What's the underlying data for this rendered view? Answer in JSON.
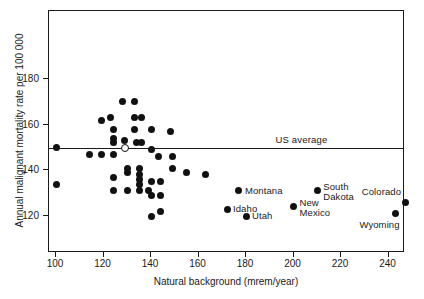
{
  "chart_data": {
    "type": "scatter",
    "title": "",
    "xlabel": "Natural background (mrem/year)",
    "ylabel": "Annual malignant mortality rate per 100 000",
    "xlim": [
      95,
      245
    ],
    "ylim": [
      112,
      196
    ],
    "xticks": [
      100,
      120,
      140,
      160,
      180,
      200,
      220,
      240
    ],
    "yticks": [
      120,
      140,
      160,
      180
    ],
    "grid": false,
    "legend": "none",
    "annotations": [
      {
        "text": "US average",
        "x": 205,
        "y": 150,
        "type": "reference-line-label"
      }
    ],
    "reference_lines": [
      {
        "name": "US average",
        "orientation": "horizontal",
        "y": 150
      }
    ],
    "series": [
      {
        "name": "states",
        "marker": "filled-circle",
        "points": [
          {
            "x": 100,
            "y": 150
          },
          {
            "x": 100,
            "y": 134
          },
          {
            "x": 114,
            "y": 147
          },
          {
            "x": 119,
            "y": 162
          },
          {
            "x": 119,
            "y": 147
          },
          {
            "x": 123,
            "y": 163
          },
          {
            "x": 124,
            "y": 158
          },
          {
            "x": 124,
            "y": 154
          },
          {
            "x": 124,
            "y": 152
          },
          {
            "x": 124,
            "y": 147
          },
          {
            "x": 124,
            "y": 137
          },
          {
            "x": 124,
            "y": 131
          },
          {
            "x": 128,
            "y": 170
          },
          {
            "x": 129,
            "y": 153
          },
          {
            "x": 130,
            "y": 141
          },
          {
            "x": 130,
            "y": 139
          },
          {
            "x": 130,
            "y": 131
          },
          {
            "x": 133,
            "y": 170
          },
          {
            "x": 133,
            "y": 163
          },
          {
            "x": 133,
            "y": 158
          },
          {
            "x": 134,
            "y": 152
          },
          {
            "x": 135,
            "y": 141
          },
          {
            "x": 135,
            "y": 138
          },
          {
            "x": 135,
            "y": 136
          },
          {
            "x": 135,
            "y": 134
          },
          {
            "x": 135,
            "y": 131
          },
          {
            "x": 136,
            "y": 163
          },
          {
            "x": 136,
            "y": 152
          },
          {
            "x": 139,
            "y": 131
          },
          {
            "x": 140,
            "y": 158
          },
          {
            "x": 140,
            "y": 149
          },
          {
            "x": 140,
            "y": 135
          },
          {
            "x": 140,
            "y": 129
          },
          {
            "x": 140,
            "y": 120
          },
          {
            "x": 143,
            "y": 146
          },
          {
            "x": 144,
            "y": 135
          },
          {
            "x": 144,
            "y": 129
          },
          {
            "x": 144,
            "y": 122
          },
          {
            "x": 148,
            "y": 157
          },
          {
            "x": 149,
            "y": 146
          },
          {
            "x": 149,
            "y": 141
          },
          {
            "x": 155,
            "y": 139
          },
          {
            "x": 163,
            "y": 138
          }
        ]
      },
      {
        "name": "US average marker",
        "marker": "open-circle",
        "points": [
          {
            "x": 129,
            "y": 150
          }
        ]
      },
      {
        "name": "labeled states",
        "marker": "filled-circle",
        "points": [
          {
            "x": 177,
            "y": 131,
            "label": "Montana",
            "label_pos": "right"
          },
          {
            "x": 172,
            "y": 123,
            "label": "Idaho",
            "label_pos": "right"
          },
          {
            "x": 180,
            "y": 120,
            "label": "Utah",
            "label_pos": "right"
          },
          {
            "x": 200,
            "y": 124,
            "label": "New\nMexico",
            "label_pos": "right"
          },
          {
            "x": 210,
            "y": 131,
            "label": "South\nDakota",
            "label_pos": "right"
          },
          {
            "x": 247,
            "y": 126,
            "label": "Colorado",
            "label_pos": "above-left"
          },
          {
            "x": 243,
            "y": 121,
            "label": "Wyoming",
            "label_pos": "below-left"
          }
        ]
      }
    ]
  },
  "colors": {
    "marker": "#111111",
    "axis": "#1a1a1a",
    "background": "#ffffff"
  }
}
